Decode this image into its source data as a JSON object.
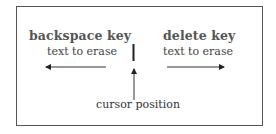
{
  "diagram": {
    "left": {
      "title": "backspace key",
      "subtitle": "text to erase",
      "direction": "left"
    },
    "right": {
      "title": "delete key",
      "subtitle": "text to erase",
      "direction": "right"
    },
    "cursor": {
      "label": "cursor position"
    },
    "colors": {
      "line": "#222222",
      "text": "#444444",
      "border": "#555555"
    }
  }
}
